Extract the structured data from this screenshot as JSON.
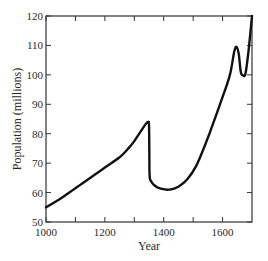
{
  "chart_data": {
    "type": "line",
    "title": "",
    "xlabel": "Year",
    "ylabel": "Population (millions)",
    "xlim": [
      1000,
      1700
    ],
    "ylim": [
      50,
      120
    ],
    "x_ticks": [
      1000,
      1200,
      1400,
      1600
    ],
    "x_minor_ticks": [
      1100,
      1300,
      1500
    ],
    "y_ticks": [
      50,
      60,
      70,
      80,
      90,
      100,
      110,
      120
    ],
    "grid": false,
    "legend": null,
    "series": [
      {
        "name": "Population",
        "color": "#111111",
        "points": [
          [
            1000,
            55
          ],
          [
            1050,
            58
          ],
          [
            1100,
            61.5
          ],
          [
            1150,
            65
          ],
          [
            1200,
            68.5
          ],
          [
            1250,
            72
          ],
          [
            1280,
            75
          ],
          [
            1300,
            77.5
          ],
          [
            1320,
            80.5
          ],
          [
            1340,
            83.5
          ],
          [
            1347,
            84
          ],
          [
            1350,
            83
          ],
          [
            1351,
            75
          ],
          [
            1352,
            66
          ],
          [
            1356,
            64
          ],
          [
            1370,
            62.3
          ],
          [
            1390,
            61.3
          ],
          [
            1420,
            61
          ],
          [
            1450,
            62
          ],
          [
            1480,
            64.5
          ],
          [
            1510,
            69
          ],
          [
            1540,
            76
          ],
          [
            1570,
            84
          ],
          [
            1600,
            92.5
          ],
          [
            1625,
            100
          ],
          [
            1640,
            108
          ],
          [
            1648,
            109.5
          ],
          [
            1655,
            107
          ],
          [
            1662,
            101
          ],
          [
            1670,
            99.8
          ],
          [
            1678,
            100.5
          ],
          [
            1688,
            108
          ],
          [
            1700,
            120
          ]
        ]
      }
    ]
  },
  "axes": {
    "xlabel": "Year",
    "ylabel": "Population (millions)"
  }
}
